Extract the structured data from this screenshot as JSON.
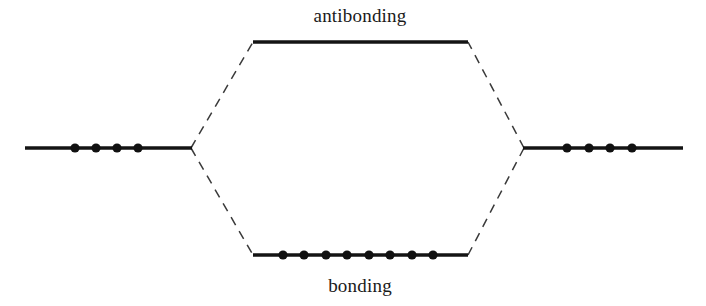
{
  "diagram": {
    "background_color": "#ffffff",
    "line_color": "#141414",
    "dash_color": "#3a3a3a",
    "electron_color": "#111111",
    "width": 706,
    "height": 306
  },
  "labels": {
    "antibonding": "antibonding",
    "bonding": "bonding"
  },
  "chart_data": {
    "type": "diagram",
    "levels": [
      {
        "key": "left_atomic",
        "name": "left atomic orbital level",
        "label": "",
        "x1": 25,
        "x2": 191,
        "y": 148,
        "electron_count": 4,
        "electron_x": [
          75,
          96,
          117,
          138
        ]
      },
      {
        "key": "right_atomic",
        "name": "right atomic orbital level",
        "label": "",
        "x1": 524,
        "x2": 683,
        "y": 148,
        "electron_count": 4,
        "electron_x": [
          567,
          589,
          610,
          632
        ]
      },
      {
        "key": "antibonding",
        "name": "antibonding molecular orbital level",
        "label": "antibonding",
        "x1": 253,
        "x2": 468,
        "y": 42,
        "electron_count": 0,
        "electron_x": [],
        "label_x": 360,
        "label_y": 22
      },
      {
        "key": "bonding",
        "name": "bonding molecular orbital level",
        "label": "bonding",
        "x1": 253,
        "x2": 468,
        "y": 255,
        "electron_count": 8,
        "electron_x": [
          283,
          304,
          326,
          347,
          369,
          390,
          412,
          433
        ],
        "label_x": 360,
        "label_y": 292
      }
    ],
    "correlation_lines": [
      {
        "name": "left-to-antibonding",
        "x1": 191,
        "y1": 148,
        "x2": 253,
        "y2": 42
      },
      {
        "name": "left-to-bonding",
        "x1": 191,
        "y1": 148,
        "x2": 253,
        "y2": 255
      },
      {
        "name": "right-to-antibonding",
        "x1": 524,
        "y1": 148,
        "x2": 468,
        "y2": 42
      },
      {
        "name": "right-to-bonding",
        "x1": 524,
        "y1": 148,
        "x2": 468,
        "y2": 255
      }
    ]
  }
}
